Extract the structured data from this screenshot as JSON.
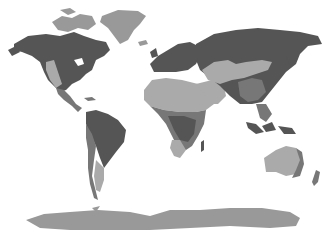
{
  "map": {
    "title": "",
    "projection": "world",
    "style": "grayscale thematic",
    "colors": {
      "background": "#ffffff",
      "dark": "#555555",
      "mid": "#777777",
      "light": "#aaaaaa",
      "ice": "#999999"
    },
    "regions": [
      {
        "name": "North America",
        "shades": [
          "dark",
          "light",
          "mid"
        ]
      },
      {
        "name": "Greenland",
        "shades": [
          "ice"
        ]
      },
      {
        "name": "South America",
        "shades": [
          "dark",
          "mid",
          "light"
        ]
      },
      {
        "name": "Europe",
        "shades": [
          "dark"
        ]
      },
      {
        "name": "Africa",
        "shades": [
          "light",
          "mid",
          "dark"
        ]
      },
      {
        "name": "Asia",
        "shades": [
          "dark",
          "light",
          "mid"
        ]
      },
      {
        "name": "Australia",
        "shades": [
          "light",
          "mid"
        ]
      },
      {
        "name": "New Zealand",
        "shades": [
          "mid"
        ]
      },
      {
        "name": "Antarctica",
        "shades": [
          "ice"
        ]
      }
    ]
  }
}
